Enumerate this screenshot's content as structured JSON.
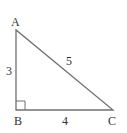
{
  "diagram": {
    "type": "right-triangle",
    "vertices": [
      {
        "label": "A",
        "x": 16,
        "y": 30
      },
      {
        "label": "B",
        "x": 16,
        "y": 110
      },
      {
        "label": "C",
        "x": 113,
        "y": 110
      }
    ],
    "sides": [
      {
        "between": "AB",
        "length_label": "3"
      },
      {
        "between": "BC",
        "length_label": "4"
      },
      {
        "between": "AC",
        "length_label": "5"
      }
    ],
    "right_angle_at": "B",
    "colors": {
      "line": "#707070",
      "text": "#333333"
    }
  }
}
